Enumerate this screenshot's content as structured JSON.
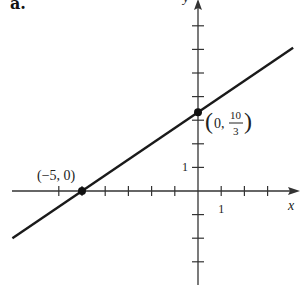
{
  "figure": {
    "part_label": "a."
  },
  "chart_data": {
    "type": "line",
    "title": "",
    "xlabel": "x",
    "ylabel": "y",
    "xlim": [
      -7,
      4
    ],
    "ylim": [
      -3,
      8
    ],
    "grid": false,
    "x_tick_step": 1,
    "y_tick_step": 1,
    "x_tick_labels": [
      {
        "value": 1,
        "label": "1"
      }
    ],
    "y_tick_labels": [
      {
        "value": 1,
        "label": "1"
      }
    ],
    "series": [
      {
        "name": "line",
        "equation": "y = (2/3)x + 10/3",
        "slope": 0.6667,
        "intercept": 3.3333,
        "x": [
          -8,
          4.1
        ],
        "y": [
          -2.0,
          6.07
        ],
        "color": "#1a1a1a"
      }
    ],
    "points": [
      {
        "x": -5,
        "y": 0,
        "label": "(−5, 0)"
      },
      {
        "x": 0,
        "y": 3.3333,
        "label_prefix": "0,",
        "label_num": "10",
        "label_den": "3"
      }
    ],
    "colors": {
      "axis": "#333333",
      "line": "#1a1a1a",
      "point": "#111111"
    }
  }
}
